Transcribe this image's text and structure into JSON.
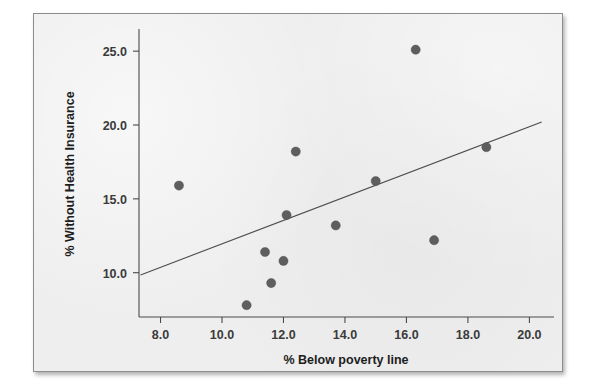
{
  "figure": {
    "panel_background": "#eeeeee",
    "border_color": "#8d8d8d"
  },
  "chart_data": {
    "type": "scatter",
    "title": "",
    "xlabel": "% Below poverty line",
    "ylabel": "% Without Health Insurance",
    "xlim": [
      7.3,
      20.8
    ],
    "ylim": [
      7.0,
      26.5
    ],
    "xticks": [
      8.0,
      10.0,
      12.0,
      14.0,
      16.0,
      18.0,
      20.0
    ],
    "xtick_labels": [
      "8.0",
      "10.0",
      "12.0",
      "14.0",
      "16.0",
      "18.0",
      "20.0"
    ],
    "yticks": [
      10.0,
      15.0,
      20.0,
      25.0
    ],
    "ytick_labels": [
      "10.0",
      "15.0",
      "20.0",
      "25.0"
    ],
    "grid": false,
    "legend": null,
    "marker_color": "#5e5e5e",
    "marker_size": 4.6,
    "points": [
      {
        "x": 8.6,
        "y": 15.9
      },
      {
        "x": 10.8,
        "y": 7.8
      },
      {
        "x": 11.4,
        "y": 11.4
      },
      {
        "x": 11.6,
        "y": 9.3
      },
      {
        "x": 12.0,
        "y": 10.8
      },
      {
        "x": 12.1,
        "y": 13.9
      },
      {
        "x": 12.4,
        "y": 18.2
      },
      {
        "x": 13.7,
        "y": 13.2
      },
      {
        "x": 15.0,
        "y": 16.2
      },
      {
        "x": 16.3,
        "y": 25.1
      },
      {
        "x": 16.9,
        "y": 12.2
      },
      {
        "x": 18.6,
        "y": 18.5
      }
    ],
    "fit_line": {
      "label": "least-squares regression line",
      "color": "#4d4d4d",
      "x_start": 7.35,
      "y_start": 9.85,
      "x_end": 20.4,
      "y_end": 20.2
    }
  }
}
